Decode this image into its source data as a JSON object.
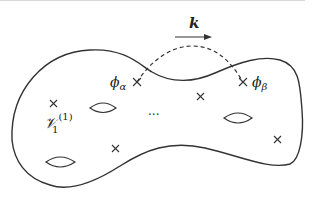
{
  "diagram": {
    "type": "riemann-surface-sketch",
    "momentum": {
      "label": "k",
      "arrow_direction": "right"
    },
    "insertions": [
      {
        "name": "phi_alpha",
        "label_base": "ϕ",
        "label_sub": "α"
      },
      {
        "name": "phi_beta",
        "label_base": "ϕ",
        "label_sub": "β"
      }
    ],
    "vertex_label": {
      "base": "𝒱",
      "sub": "1",
      "sup": "(1)"
    },
    "ellipsis": "···",
    "holes": 3,
    "unlabeled_punctures": 4,
    "colors": {
      "stroke": "#333333",
      "background": "#ffffff"
    }
  }
}
